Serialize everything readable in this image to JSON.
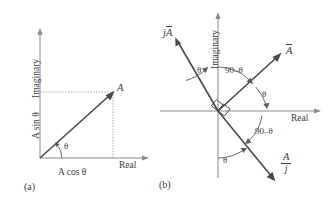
{
  "figure": {
    "panels": [
      {
        "id": "a",
        "caption": "(a)",
        "axes": {
          "imaginary_label": "Imaginary",
          "real_label": "Real"
        },
        "labels": {
          "vector_tip": "A",
          "angle": "θ",
          "projection_y": "A sin θ",
          "projection_x": "A cos θ"
        }
      },
      {
        "id": "b",
        "caption": "(b)",
        "axes": {
          "imaginary_label": "Imaginary",
          "real_label": "Real"
        },
        "vectors": [
          {
            "name": "A-bar",
            "label_main": "A",
            "label_prefix": "",
            "label_den": ""
          },
          {
            "name": "jA-bar",
            "label_main": "A",
            "label_prefix": "j",
            "label_den": ""
          },
          {
            "name": "A-bar-over-j",
            "label_main": "A",
            "label_prefix": "",
            "label_den": "j"
          }
        ],
        "angles": [
          {
            "name": "theta-upper-left",
            "text": "θ"
          },
          {
            "name": "ninety-minus-theta-upper",
            "text": "90–θ"
          },
          {
            "name": "theta-upper-right",
            "text": "θ"
          },
          {
            "name": "ninety-minus-theta-lower",
            "text": "90–θ"
          },
          {
            "name": "theta-lower",
            "text": "θ"
          }
        ]
      }
    ],
    "colors": {
      "axis": "#8a8a8a",
      "vector": "#4a4a4a",
      "dotted": "#9b9b9b",
      "text": "#3b3b3b",
      "background": "#ffffff"
    }
  }
}
